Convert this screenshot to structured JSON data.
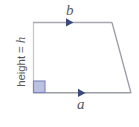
{
  "figure": {
    "shape": "trapezoid",
    "labels": {
      "top_side": "b",
      "bottom_side": "a",
      "height_prefix": "height = ",
      "height_variable": "h",
      "height_full": "height = h"
    },
    "colors": {
      "background": "#ffffff",
      "outline": "#9a9ca6",
      "outline_light": "#c7cad4",
      "label_text": "#58595b",
      "right_angle_fill": "#aeb6dc",
      "right_angle_stroke": "#7b85bd",
      "arrow": "#3b4a7a"
    },
    "geometry": {
      "top_left": [
        33,
        22
      ],
      "top_right": [
        112,
        22
      ],
      "bottom_right": [
        131,
        93
      ],
      "bottom_left": [
        33,
        93
      ],
      "right_angle_marker": [
        33,
        81,
        12,
        12
      ],
      "top_arrow_x": 71,
      "bottom_arrow_x": 83
    },
    "markers": {
      "top_arrow": "arrow-right-marker",
      "bottom_arrow": "arrow-right-marker",
      "corner": "right-angle-square"
    }
  }
}
